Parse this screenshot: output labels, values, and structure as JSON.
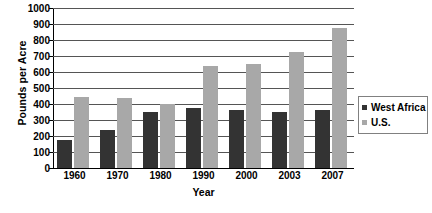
{
  "chart_data": {
    "type": "bar",
    "title": "",
    "xlabel": "Year",
    "ylabel": "Pounds per Acre",
    "categories": [
      "1960",
      "1970",
      "1980",
      "1990",
      "2000",
      "2003",
      "2007"
    ],
    "series": [
      {
        "name": "West Africa",
        "color": "#333333",
        "values": [
          175,
          240,
          350,
          375,
          365,
          350,
          360
        ]
      },
      {
        "name": "U.S.",
        "color": "#a8a8a8",
        "values": [
          445,
          437,
          403,
          635,
          652,
          722,
          872
        ]
      }
    ],
    "ylim": [
      0,
      1000
    ],
    "ytick_step": 100,
    "yticks": [
      "1000",
      "900",
      "800",
      "700",
      "600",
      "500",
      "400",
      "300",
      "200",
      "100",
      "0"
    ],
    "grid": true,
    "legend_position": "right"
  }
}
